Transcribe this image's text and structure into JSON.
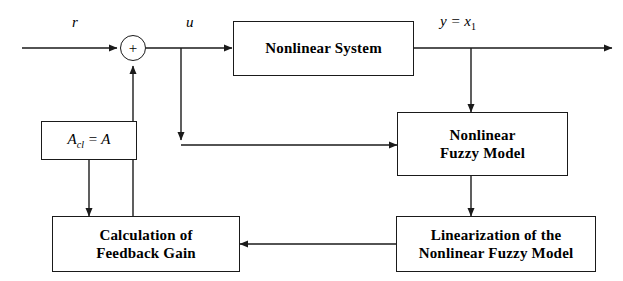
{
  "diagram": {
    "type": "control-block-diagram",
    "background": "#ffffff",
    "line_color": "#1a1a1a",
    "text_color": "#000000"
  },
  "signals": {
    "reference": "r",
    "control": "u",
    "output_prefix": "y = x",
    "output_subscript": "1"
  },
  "summing_junction": {
    "sign": "+"
  },
  "blocks": {
    "gain_matrix": {
      "label": "A",
      "subscript": "cl",
      "equals": " = A",
      "full_text": "Aₑₗ = A"
    },
    "nonlinear_system": {
      "line1": "Nonlinear System"
    },
    "nonlinear_fuzzy_model": {
      "line1": "Nonlinear",
      "line2": "Fuzzy Model"
    },
    "linearization": {
      "line1": "Linearization of the",
      "line2": "Nonlinear Fuzzy Model"
    },
    "feedback_gain": {
      "line1": "Calculation of",
      "line2": "Feedback Gain"
    }
  }
}
